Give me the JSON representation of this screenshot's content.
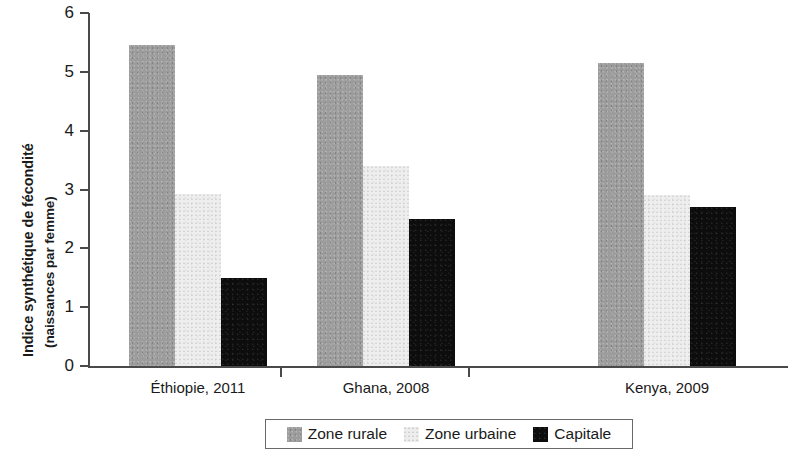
{
  "chart_data": {
    "type": "bar",
    "title": "",
    "subtitle": "",
    "xlabel": "",
    "ylabel_line1": "Indice synthétique de fécondité",
    "ylabel_line2": "(naissances par femme)",
    "categories": [
      "Éthiopie, 2011",
      "Ghana, 2008",
      "Kenya, 2009"
    ],
    "series": [
      {
        "name": "Zone rurale",
        "color": "#9c9c9c",
        "values": [
          5.45,
          4.95,
          5.15
        ]
      },
      {
        "name": "Zone urbaine",
        "color": "#eeeeee",
        "values": [
          2.92,
          3.4,
          2.9
        ]
      },
      {
        "name": "Capitale",
        "color": "#0d0d0d",
        "values": [
          1.5,
          2.5,
          2.7
        ]
      }
    ],
    "ylim": [
      0,
      6
    ],
    "yticks": [
      0,
      1,
      2,
      3,
      4,
      5,
      6
    ],
    "ytick_labels": [
      "0",
      "1",
      "2",
      "3",
      "4",
      "5",
      "6"
    ],
    "grid": false,
    "legend_position": "bottom",
    "legend_entries": [
      "Zone rurale",
      "Zone urbaine",
      "Capitale"
    ]
  },
  "axis": {
    "line_color": "#4a4a4a"
  }
}
